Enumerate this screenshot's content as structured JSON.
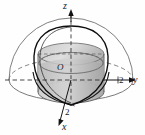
{
  "figure": {
    "title": "",
    "kind": "3d-solid-geometry-diagram"
  },
  "axes": {
    "z": {
      "label": "z",
      "icon": "axis-arrow-up-icon"
    },
    "y": {
      "label": "y",
      "icon": "axis-arrow-right-icon"
    },
    "x": {
      "label": "x",
      "icon": "axis-arrow-down-left-icon"
    }
  },
  "ticks": {
    "y_tick": "2",
    "x_tick": "2"
  },
  "origin": {
    "label": "O"
  },
  "colors": {
    "stroke_light": "#6f6f6f",
    "stroke_dark": "#111111",
    "fill_light": "#d8d8d8",
    "fill_mid": "#bdbdbd",
    "fill_dark": "#a8a8a8",
    "background": "#fefefe"
  }
}
